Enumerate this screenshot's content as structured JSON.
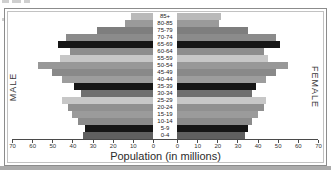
{
  "figure": {
    "left_axis_label": "MALE",
    "right_axis_label": "FEMALE",
    "xaxis_title": "Population (in millions)"
  },
  "chart_data": {
    "type": "bar",
    "subtype": "population-pyramid",
    "title": "",
    "xlabel": "Population (in millions)",
    "ylabel": "",
    "xlim": [
      0,
      70
    ],
    "grid": false,
    "legend_position": "none",
    "categories_top_to_bottom": [
      "85+",
      "80-85",
      "75-79",
      "70-74",
      "65-69",
      "60-64",
      "55-59",
      "50-54",
      "45-49",
      "40-44",
      "35-39",
      "30-34",
      "25-29",
      "20-24",
      "15-19",
      "10-14",
      "5-9",
      "0-4"
    ],
    "series": [
      {
        "name": "MALE",
        "side": "left",
        "values": [
          11,
          14,
          28,
          43,
          47,
          41,
          46,
          57,
          50,
          45,
          39,
          36,
          45,
          42,
          40,
          37,
          34,
          35
        ]
      },
      {
        "name": "FEMALE",
        "side": "right",
        "values": [
          22,
          21,
          35,
          49,
          51,
          43,
          45,
          55,
          49,
          44,
          39,
          37,
          44,
          43,
          40,
          37,
          35,
          34
        ]
      }
    ],
    "axis_ticks_left": [
      70,
      60,
      50,
      40,
      30,
      20,
      10,
      0
    ],
    "axis_ticks_right": [
      0,
      10,
      20,
      30,
      40,
      50,
      60,
      70
    ],
    "row_colors": [
      "#bababa",
      "#9a9a9a",
      "#7e7e7e",
      "#8b8b8b",
      "#161616",
      "#8d8d8d",
      "#c7c7c7",
      "#989898",
      "#898989",
      "#9d9d9d",
      "#161616",
      "#6f6f6f",
      "#c7c7c7",
      "#909090",
      "#9b9b9b",
      "#8b8b8b",
      "#161616",
      "#606060"
    ]
  }
}
